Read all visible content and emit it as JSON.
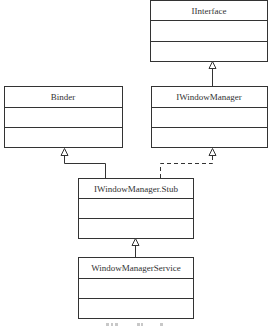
{
  "diagram": {
    "type": "uml-class-diagram",
    "classes": [
      {
        "id": "iinterface",
        "name": "IInterface",
        "compartments": [
          "",
          ""
        ]
      },
      {
        "id": "binder",
        "name": "Binder",
        "compartments": [
          "",
          ""
        ]
      },
      {
        "id": "iwindowmanager",
        "name": "IWindowManager",
        "compartments": [
          "",
          ""
        ]
      },
      {
        "id": "stub",
        "name": "IWindowManager.Stub",
        "compartments": [
          "",
          ""
        ]
      },
      {
        "id": "service",
        "name": "WindowManagerService",
        "compartments": [
          "",
          ""
        ]
      }
    ],
    "relations": [
      {
        "from": "IWindowManager",
        "to": "IInterface",
        "kind": "generalization",
        "line": "solid"
      },
      {
        "from": "IWindowManager.Stub",
        "to": "Binder",
        "kind": "generalization",
        "line": "solid"
      },
      {
        "from": "IWindowManager.Stub",
        "to": "IWindowManager",
        "kind": "realization",
        "line": "dashed"
      },
      {
        "from": "WindowManagerService",
        "to": "IWindowManager.Stub",
        "kind": "generalization",
        "line": "solid"
      }
    ]
  },
  "colors": {
    "line": "#333333",
    "background": "#ffffff",
    "text": "#333333"
  }
}
